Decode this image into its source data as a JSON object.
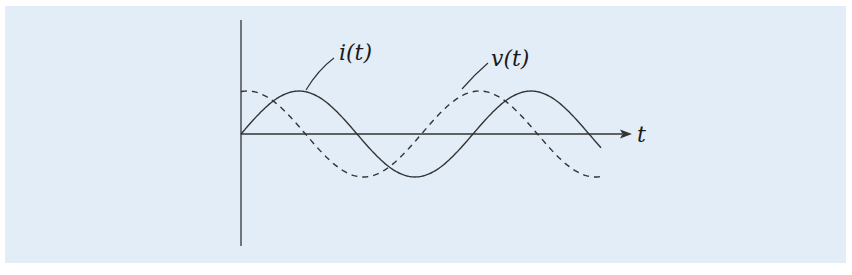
{
  "figure": {
    "background_color": "#e3edf8",
    "line_color": "#333333",
    "labels": {
      "current": "i(t)",
      "voltage": "v(t)",
      "time_axis": "t"
    }
  },
  "chart_data": {
    "type": "line",
    "title": "",
    "xlabel": "t",
    "ylabel": "",
    "grid": false,
    "series": [
      {
        "name": "i(t)",
        "style": "solid",
        "function": "sin(t)",
        "amplitude": 1.0,
        "phase_deg": 0
      },
      {
        "name": "v(t)",
        "style": "dashed",
        "function": "sin(t + phi)",
        "amplitude": 1.0,
        "phase_deg": 80
      }
    ],
    "x_range_periods": [
      0,
      1.55
    ],
    "annotations": [
      "i(t) leader to solid curve first peak",
      "v(t) leader to dashed curve second peak"
    ]
  }
}
